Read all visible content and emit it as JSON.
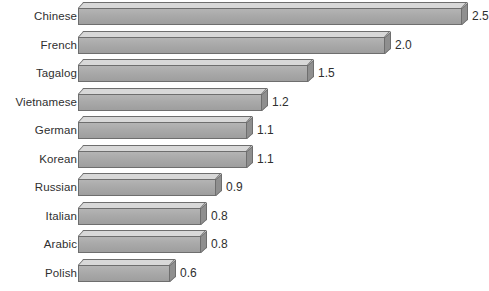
{
  "chart_data": {
    "type": "bar",
    "orientation": "horizontal",
    "title": "",
    "subtitle": "",
    "xlabel": "",
    "ylabel": "",
    "categories": [
      "Chinese",
      "French",
      "Tagalog",
      "Vietnamese",
      "German",
      "Korean",
      "Russian",
      "Italian",
      "Arabic",
      "Polish"
    ],
    "values": [
      2.5,
      2.0,
      1.5,
      1.2,
      1.1,
      1.1,
      0.9,
      0.8,
      0.8,
      0.6
    ],
    "value_labels": [
      "2.5",
      "2.0",
      "1.5",
      "1.2",
      "1.1",
      "1.1",
      "0.9",
      "0.8",
      "0.8",
      "0.6"
    ],
    "xlim": [
      0,
      2.5
    ],
    "grid": false,
    "legend": null,
    "annotations": [],
    "style": {
      "bar_front_color": "#a9a9a9",
      "bar_top_color": "#d8d8d8",
      "bar_side_color": "#8f8f8f",
      "bar_outline_color": "#6e6e6e",
      "background_color": "#ffffff",
      "text_color": "#2f2f2f",
      "effect": "3d-extruded"
    }
  }
}
